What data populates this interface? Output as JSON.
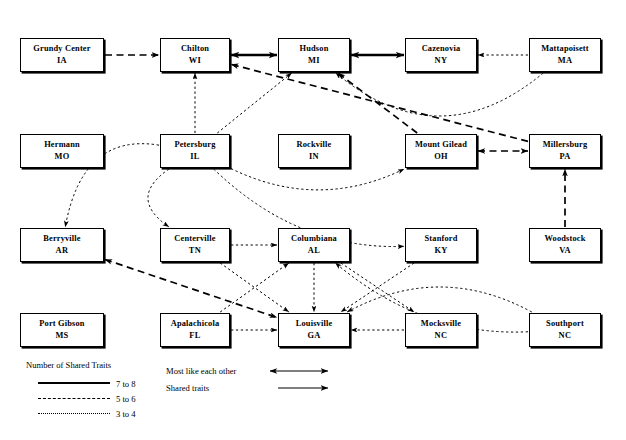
{
  "diagram": {
    "title": "Number of Shared Traits",
    "nodes": [
      {
        "id": "grundy",
        "city": "Grundy Center",
        "state": "IA",
        "x": 20,
        "y": 38,
        "w": 84,
        "h": 34
      },
      {
        "id": "chilton",
        "city": "Chilton",
        "state": "WI",
        "x": 160,
        "y": 38,
        "w": 70,
        "h": 34
      },
      {
        "id": "hudson",
        "city": "Hudson",
        "state": "MI",
        "x": 278,
        "y": 38,
        "w": 72,
        "h": 34
      },
      {
        "id": "cazenovia",
        "city": "Cazenovia",
        "state": "NY",
        "x": 405,
        "y": 38,
        "w": 72,
        "h": 34
      },
      {
        "id": "mattapoisett",
        "city": "Mattapoisett",
        "state": "MA",
        "x": 529,
        "y": 38,
        "w": 72,
        "h": 34
      },
      {
        "id": "hermann",
        "city": "Hermann",
        "state": "MO",
        "x": 20,
        "y": 134,
        "w": 84,
        "h": 34
      },
      {
        "id": "petersburg",
        "city": "Petersburg",
        "state": "IL",
        "x": 160,
        "y": 134,
        "w": 70,
        "h": 34
      },
      {
        "id": "rockville",
        "city": "Rockville",
        "state": "IN",
        "x": 278,
        "y": 134,
        "w": 72,
        "h": 34
      },
      {
        "id": "mountgilead",
        "city": "Mount Gilead",
        "state": "OH",
        "x": 405,
        "y": 134,
        "w": 72,
        "h": 34
      },
      {
        "id": "millersburg",
        "city": "Millersburg",
        "state": "PA",
        "x": 529,
        "y": 134,
        "w": 72,
        "h": 34
      },
      {
        "id": "berryville",
        "city": "Berryville",
        "state": "AR",
        "x": 20,
        "y": 228,
        "w": 84,
        "h": 34
      },
      {
        "id": "centerville",
        "city": "Centerville",
        "state": "TN",
        "x": 160,
        "y": 228,
        "w": 70,
        "h": 34
      },
      {
        "id": "columbiana",
        "city": "Columbiana",
        "state": "AL",
        "x": 278,
        "y": 228,
        "w": 72,
        "h": 34
      },
      {
        "id": "stanford",
        "city": "Stanford",
        "state": "KY",
        "x": 405,
        "y": 228,
        "w": 72,
        "h": 34
      },
      {
        "id": "woodstock",
        "city": "Woodstock",
        "state": "VA",
        "x": 529,
        "y": 228,
        "w": 72,
        "h": 34
      },
      {
        "id": "portgibson",
        "city": "Port Gibson",
        "state": "MS",
        "x": 20,
        "y": 313,
        "w": 84,
        "h": 34
      },
      {
        "id": "apalachicola",
        "city": "Apalachicola",
        "state": "FL",
        "x": 160,
        "y": 313,
        "w": 70,
        "h": 34
      },
      {
        "id": "louisville",
        "city": "Louisville",
        "state": "GA",
        "x": 278,
        "y": 313,
        "w": 72,
        "h": 34
      },
      {
        "id": "mocksville",
        "city": "Mocksville",
        "state": "NC",
        "x": 405,
        "y": 313,
        "w": 72,
        "h": 34
      },
      {
        "id": "southport",
        "city": "Southport",
        "state": "NC",
        "x": 529,
        "y": 313,
        "w": 72,
        "h": 34
      }
    ],
    "edges": [
      {
        "from": "grundy",
        "to": "chilton",
        "weight": "5 to 6",
        "style": "dashed",
        "bidirectional": false
      },
      {
        "from": "chilton",
        "to": "hudson",
        "weight": "7 to 8",
        "style": "solid",
        "bidirectional": true
      },
      {
        "from": "hudson",
        "to": "cazenovia",
        "weight": "7 to 8",
        "style": "solid",
        "bidirectional": true
      },
      {
        "from": "mattapoisett",
        "to": "cazenovia",
        "weight": "3 to 4",
        "style": "dotted",
        "bidirectional": false
      },
      {
        "from": "mattapoisett",
        "to": "hudson",
        "weight": "3 to 4",
        "style": "dotted",
        "bidirectional": false
      },
      {
        "from": "petersburg",
        "to": "chilton",
        "weight": "3 to 4",
        "style": "dotted",
        "bidirectional": false
      },
      {
        "from": "petersburg",
        "to": "hudson",
        "weight": "3 to 4",
        "style": "dotted",
        "bidirectional": false
      },
      {
        "from": "petersburg",
        "to": "mountgilead",
        "weight": "3 to 4",
        "style": "dotted",
        "bidirectional": false
      },
      {
        "from": "petersburg",
        "to": "stanford",
        "weight": "3 to 4",
        "style": "dotted",
        "bidirectional": false
      },
      {
        "from": "petersburg",
        "to": "centerville",
        "weight": "3 to 4",
        "style": "dotted",
        "bidirectional": false
      },
      {
        "from": "petersburg",
        "to": "berryville",
        "weight": "3 to 4",
        "style": "dotted",
        "bidirectional": false
      },
      {
        "from": "millersburg",
        "to": "chilton",
        "weight": "5 to 6",
        "style": "dashed",
        "bidirectional": false
      },
      {
        "from": "mountgilead",
        "to": "hudson",
        "weight": "5 to 6",
        "style": "dashed",
        "bidirectional": false
      },
      {
        "from": "mountgilead",
        "to": "millersburg",
        "weight": "5 to 6",
        "style": "dashed",
        "bidirectional": true
      },
      {
        "from": "woodstock",
        "to": "millersburg",
        "weight": "5 to 6",
        "style": "dashed",
        "bidirectional": false
      },
      {
        "from": "berryville",
        "to": "louisville",
        "weight": "5 to 6",
        "style": "dashed",
        "bidirectional": true
      },
      {
        "from": "centerville",
        "to": "louisville",
        "weight": "3 to 4",
        "style": "dotted",
        "bidirectional": false
      },
      {
        "from": "centerville",
        "to": "columbiana",
        "weight": "3 to 4",
        "style": "dotted",
        "bidirectional": false
      },
      {
        "from": "apalachicola",
        "to": "louisville",
        "weight": "3 to 4",
        "style": "dotted",
        "bidirectional": false
      },
      {
        "from": "apalachicola",
        "to": "columbiana",
        "weight": "3 to 4",
        "style": "dotted",
        "bidirectional": false
      },
      {
        "from": "stanford",
        "to": "louisville",
        "weight": "3 to 4",
        "style": "dotted",
        "bidirectional": false
      },
      {
        "from": "columbiana",
        "to": "louisville",
        "weight": "3 to 4",
        "style": "dotted",
        "bidirectional": false
      },
      {
        "from": "columbiana",
        "to": "mocksville",
        "weight": "3 to 4",
        "style": "dotted",
        "bidirectional": false
      },
      {
        "from": "mocksville",
        "to": "louisville",
        "weight": "3 to 4",
        "style": "dotted",
        "bidirectional": false
      },
      {
        "from": "southport",
        "to": "louisville",
        "weight": "3 to 4",
        "style": "dotted",
        "bidirectional": false
      },
      {
        "from": "southport",
        "to": "columbiana",
        "weight": "3 to 4",
        "style": "dotted",
        "bidirectional": false
      }
    ]
  },
  "legend": {
    "title": "Number of Shared Traits",
    "items": [
      {
        "label": "7 to 8",
        "style": "solid"
      },
      {
        "label": "5 to 6",
        "style": "dashed"
      },
      {
        "label": "3 to 4",
        "style": "dotted"
      }
    ],
    "arrows": [
      {
        "label": "Most like each other",
        "type": "double"
      },
      {
        "label": "Shared traits",
        "type": "single"
      }
    ]
  },
  "colors": {
    "ink": "#000000",
    "background": "#ffffff"
  }
}
